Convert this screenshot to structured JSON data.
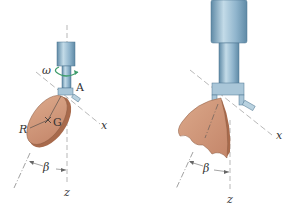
{
  "figure": {
    "left_panel": {
      "name": "thin circular disk pendulum",
      "labels": {
        "omega": "ω",
        "pivot": "A",
        "center": "G",
        "radius": "R",
        "x_axis": "x",
        "z_axis": "z",
        "angle": "β"
      }
    },
    "right_panel": {
      "name": "disk swung outward by rotation",
      "labels": {
        "x_axis": "x",
        "z_axis": "z",
        "angle": "β"
      }
    },
    "colors": {
      "shaft": "#8fb4cc",
      "shaft_dark": "#5f8aa6",
      "shaft_light": "#c3dbe8",
      "disk": "#d39a7a",
      "disk_edge": "#a86a4c",
      "omega_arrow": "#3d9c6a",
      "axis_line": "#888888"
    }
  }
}
